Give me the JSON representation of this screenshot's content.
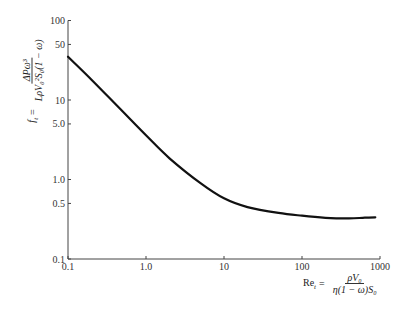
{
  "chart_data": {
    "type": "line",
    "title": "",
    "xscale": "log",
    "yscale": "log",
    "xlabel": "Re_t = ρV0 / (η(1 − ω)S0)",
    "ylabel": "f_t = ΔPω³ / (LρV0²S0(1 − ω))",
    "xlim": [
      0.1,
      1000
    ],
    "ylim": [
      0.1,
      100
    ],
    "grid": false,
    "legend": null,
    "x_ticks": [
      "0.1",
      "1.0",
      "10",
      "100",
      "1000"
    ],
    "y_ticks": [
      "0.1",
      "0.5",
      "1.0",
      "5.0",
      "10",
      "50",
      "100"
    ],
    "series": [
      {
        "name": "f_t vs Re_t",
        "x": [
          0.1,
          0.2,
          0.5,
          1.0,
          2.0,
          5.0,
          10,
          20,
          50,
          100,
          200,
          400,
          600,
          870
        ],
        "y": [
          35,
          18,
          7.2,
          3.6,
          1.85,
          0.9,
          0.58,
          0.45,
          0.38,
          0.35,
          0.33,
          0.325,
          0.33,
          0.335
        ]
      }
    ]
  },
  "axes": {
    "y_label": {
      "lhs": "f",
      "lhs_sub": "t",
      "eq": "=",
      "num": "ΔPω³",
      "den": "LρV₀²S₀(1 − ω)"
    },
    "x_label": {
      "lhs": "Re",
      "lhs_sub": "t",
      "eq": "=",
      "num": "ρV₀",
      "den": "η(1 − ω)S₀"
    }
  },
  "style": {
    "line_color": "#111111",
    "axis_color": "#444444",
    "background": "#ffffff"
  }
}
